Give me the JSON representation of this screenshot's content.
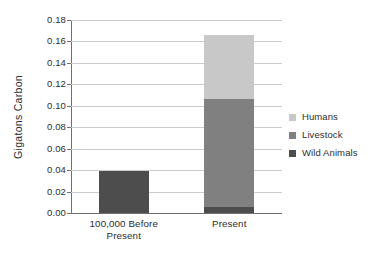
{
  "chart_data": {
    "type": "bar",
    "subtype": "stacked-bar",
    "title": "",
    "subtitle": "",
    "xlabel": "",
    "ylabel": "Gigatons Carbon",
    "categories": [
      "100,000 Before Present",
      "Present"
    ],
    "category_label_lines": [
      [
        "100,000 Before",
        "Present"
      ],
      [
        "Present"
      ]
    ],
    "series": [
      {
        "name": "Wild Animals",
        "values": [
          0.039,
          0.006
        ],
        "color": "#4d4d4d"
      },
      {
        "name": "Livestock",
        "values": [
          0.0,
          0.1
        ],
        "color": "#808080"
      },
      {
        "name": "Humans",
        "values": [
          0.0,
          0.06
        ],
        "color": "#c8c8c8"
      }
    ],
    "stack_order_bottom_to_top": [
      "Wild Animals",
      "Livestock",
      "Humans"
    ],
    "stack_totals": [
      0.039,
      0.166
    ],
    "ylim": [
      0.0,
      0.18
    ],
    "ytick_step": 0.02,
    "ytick_labels": [
      "0.00",
      "0.02",
      "0.04",
      "0.06",
      "0.08",
      "0.10",
      "0.12",
      "0.14",
      "0.16",
      "0.18"
    ],
    "ytick_values": [
      0.0,
      0.02,
      0.04,
      0.06,
      0.08,
      0.1,
      0.12,
      0.14,
      0.16,
      0.18
    ],
    "grid": true,
    "grid_axis": "y",
    "legend_position": "right",
    "legend_entries": [
      "Humans",
      "Livestock",
      "Wild Animals"
    ],
    "annotations": []
  },
  "legend": {
    "items": [
      {
        "label": "Humans",
        "color": "#c8c8c8"
      },
      {
        "label": "Livestock",
        "color": "#808080"
      },
      {
        "label": "Wild Animals",
        "color": "#4d4d4d"
      }
    ]
  },
  "axes": {
    "y_title": "Gigatons Carbon",
    "y_ticks": [
      "0.18",
      "0.16",
      "0.14",
      "0.12",
      "0.10",
      "0.08",
      "0.06",
      "0.04",
      "0.02",
      "0.00"
    ],
    "x_categories": [
      {
        "line1": "100,000 Before",
        "line2": "Present"
      },
      {
        "line1": "Present",
        "line2": ""
      }
    ]
  },
  "colors": {
    "humans": "#c8c8c8",
    "livestock": "#808080",
    "wild_animals": "#4d4d4d",
    "gridline": "#c9cdd2",
    "axis": "#6f6f6f",
    "text": "#2e2e2e",
    "background": "#ffffff"
  }
}
